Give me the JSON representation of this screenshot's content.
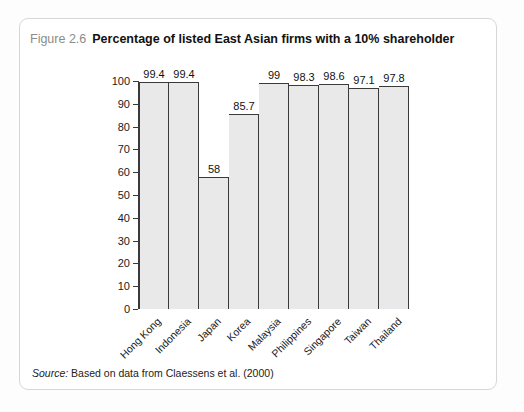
{
  "figure": {
    "number": "Figure 2.6",
    "title": "Percentage of listed East Asian firms with a 10% shareholder",
    "source_lead": "Source:",
    "source_text": "Based on data from Claessens et al. (2000)"
  },
  "colors": {
    "bar_fill": "#e9e9e9",
    "bar_outline": "#3a3a3a",
    "card_border": "#d7d7d7",
    "page_background": "#fdfdfd",
    "title_text": "#111111",
    "figure_number_text": "#8b8b8b"
  },
  "chart_data": {
    "type": "bar",
    "title": "Percentage of listed East Asian firms with a 10% shareholder",
    "xlabel": "",
    "ylabel": "",
    "ylim": [
      0,
      100
    ],
    "yticks": [
      0,
      10,
      20,
      30,
      40,
      50,
      60,
      70,
      80,
      90,
      100
    ],
    "ytick_labels": [
      "0",
      "10",
      "20",
      "30",
      "40",
      "50",
      "60",
      "70",
      "80",
      "90",
      "100"
    ],
    "grid": false,
    "legend": false,
    "bar_gap": 0,
    "categories": [
      "Hong Kong",
      "Indonesia",
      "Japan",
      "Korea",
      "Malaysia",
      "Philippines",
      "Singapore",
      "Taiwan",
      "Thailand"
    ],
    "values": [
      99.4,
      99.4,
      58,
      85.7,
      99,
      98.3,
      98.6,
      97.1,
      97.8
    ],
    "value_labels": [
      "99.4",
      "99.4",
      "58",
      "85.7",
      "99",
      "98.3",
      "98.6",
      "97.1",
      "97.8"
    ]
  }
}
